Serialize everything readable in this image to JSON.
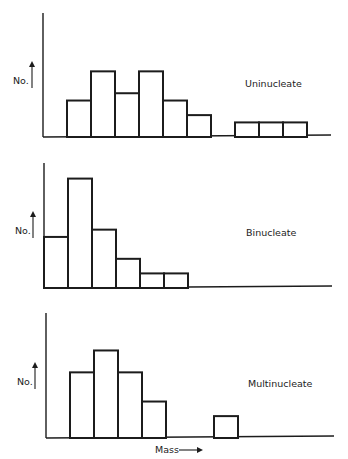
{
  "chart_data": [
    {
      "type": "bar",
      "title": "Uninucleate",
      "xlabel": "",
      "ylabel": "No.",
      "bins": [
        0,
        1,
        2,
        3,
        4,
        5,
        6,
        7,
        8,
        9,
        10,
        11
      ],
      "values": [
        0,
        5,
        9,
        6,
        9,
        5,
        3,
        0,
        2,
        2,
        2,
        0
      ],
      "ylim": [
        0,
        17
      ],
      "grid": false
    },
    {
      "type": "bar",
      "title": "Binucleate",
      "xlabel": "",
      "ylabel": "No.",
      "bins": [
        0,
        1,
        2,
        3,
        4,
        5,
        6,
        7,
        8,
        9,
        10,
        11
      ],
      "values": [
        7,
        15,
        8,
        4,
        2,
        2,
        0,
        0,
        0,
        0,
        0,
        0
      ],
      "ylim": [
        0,
        17
      ],
      "grid": false
    },
    {
      "type": "bar",
      "title": "Multinucleate",
      "xlabel": "Mass",
      "ylabel": "No.",
      "bins": [
        0,
        1,
        2,
        3,
        4,
        5,
        6,
        7,
        8,
        9,
        10,
        11
      ],
      "values": [
        0,
        9,
        12,
        9,
        5,
        0,
        0,
        3,
        0,
        0,
        0,
        0
      ],
      "ylim": [
        0,
        17
      ],
      "grid": false
    }
  ],
  "labels": {
    "panel_titles": [
      "Uninucleate",
      "Binucleate",
      "Multinucleate"
    ],
    "y_axis_label": "No.",
    "x_axis_label": "Mass"
  }
}
